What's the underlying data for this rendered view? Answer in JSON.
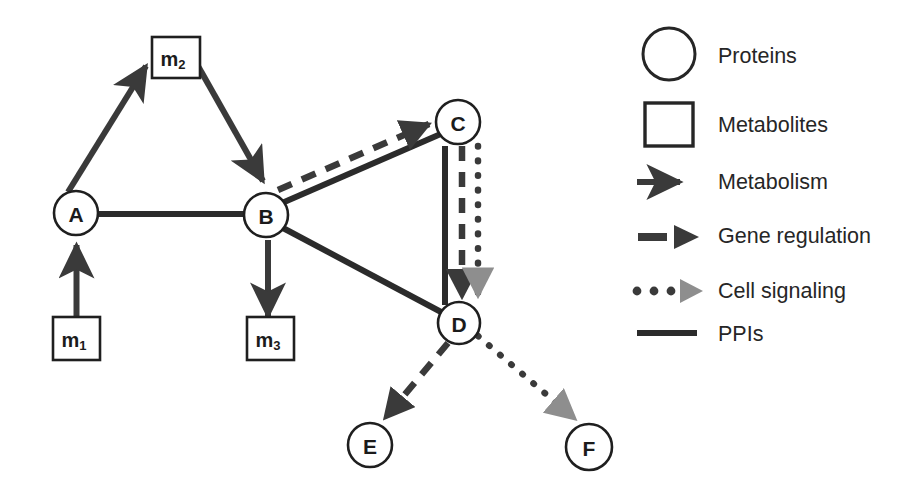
{
  "canvas": {
    "width": 915,
    "height": 493,
    "background": "#ffffff"
  },
  "colors": {
    "stroke_dark": "#2b2b2b",
    "stroke_mid": "#3a3a3a",
    "arrow_gray": "#8a8a8a",
    "text": "#262626",
    "node_fill": "#ffffff"
  },
  "network": {
    "proteins": [
      {
        "id": "A",
        "label": "A",
        "cx": 76,
        "cy": 213,
        "r": 22
      },
      {
        "id": "B",
        "label": "B",
        "cx": 266,
        "cy": 215,
        "r": 22
      },
      {
        "id": "C",
        "label": "C",
        "cx": 458,
        "cy": 122,
        "r": 22
      },
      {
        "id": "D",
        "label": "D",
        "cx": 459,
        "cy": 323,
        "r": 21
      },
      {
        "id": "E",
        "label": "E",
        "cx": 370,
        "cy": 445,
        "r": 22
      },
      {
        "id": "F",
        "label": "F",
        "cx": 589,
        "cy": 447,
        "r": 23
      }
    ],
    "metabolites": [
      {
        "id": "m1",
        "base": "m",
        "sub": "1",
        "x": 53,
        "y": 317,
        "w": 47,
        "h": 43
      },
      {
        "id": "m2",
        "base": "m",
        "sub": "2",
        "x": 152,
        "y": 37,
        "w": 48,
        "h": 41
      },
      {
        "id": "m3",
        "base": "m",
        "sub": "3",
        "x": 247,
        "y": 317,
        "w": 47,
        "h": 43
      }
    ],
    "edges": [
      {
        "id": "m1-to-A",
        "from": "m1",
        "to": "A",
        "type": "metabolism",
        "arrow": true
      },
      {
        "id": "A-to-m2",
        "from": "A",
        "to": "m2",
        "type": "metabolism",
        "arrow": true
      },
      {
        "id": "m2-to-B",
        "from": "m2",
        "to": "B",
        "type": "metabolism",
        "arrow": true
      },
      {
        "id": "B-to-m3",
        "from": "B",
        "to": "m3",
        "type": "metabolism",
        "arrow": true
      },
      {
        "id": "A-to-B",
        "from": "A",
        "to": "B",
        "type": "ppi",
        "arrow": false
      },
      {
        "id": "B-to-C-ppi",
        "from": "B",
        "to": "C",
        "type": "ppi",
        "arrow": false
      },
      {
        "id": "B-to-C-gene",
        "from": "B",
        "to": "C",
        "type": "gene_regulation",
        "arrow": true
      },
      {
        "id": "B-to-D-ppi",
        "from": "B",
        "to": "D",
        "type": "ppi",
        "arrow": false
      },
      {
        "id": "C-to-D-ppi",
        "from": "C",
        "to": "D",
        "type": "ppi",
        "arrow": false
      },
      {
        "id": "C-to-D-gene",
        "from": "C",
        "to": "D",
        "type": "gene_regulation",
        "arrow": true
      },
      {
        "id": "C-to-D-signal",
        "from": "C",
        "to": "D",
        "type": "cell_signaling",
        "arrow": true
      },
      {
        "id": "D-to-E-gene",
        "from": "D",
        "to": "E",
        "type": "gene_regulation",
        "arrow": true
      },
      {
        "id": "D-to-F-signal",
        "from": "D",
        "to": "F",
        "type": "cell_signaling",
        "arrow": true
      }
    ]
  },
  "legend": {
    "items": [
      {
        "key": "proteins",
        "label": "Proteins",
        "symbol": "circle-outline-icon",
        "y": 56
      },
      {
        "key": "metabolites",
        "label": "Metabolites",
        "symbol": "square-outline-icon",
        "y": 125
      },
      {
        "key": "metabolism",
        "label": "Metabolism",
        "symbol": "solid-arrow-icon",
        "y": 182
      },
      {
        "key": "gene_regulation",
        "label": "Gene regulation",
        "symbol": "dashed-arrow-icon",
        "y": 236
      },
      {
        "key": "cell_signaling",
        "label": "Cell signaling",
        "symbol": "dotted-arrow-icon",
        "y": 291
      },
      {
        "key": "ppis",
        "label": "PPIs",
        "symbol": "solid-line-icon",
        "y": 334
      }
    ],
    "text_x": 718
  }
}
